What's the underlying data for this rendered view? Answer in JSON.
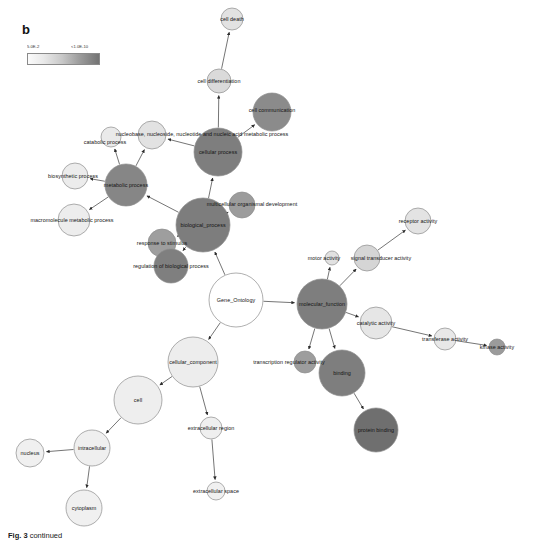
{
  "figure": {
    "panel_label": "b",
    "caption_prefix": "Fig. 3",
    "caption_text": "continued"
  },
  "legend": {
    "name": "p-value-color-scale",
    "min_label": "5.0E-2",
    "max_label": "<1.0E-10",
    "color_min": "#fbfbfb",
    "color_max": "#737373",
    "orientation": "horizontal"
  },
  "chart_data": {
    "type": "network",
    "legend_position": "top-left",
    "color_scale": {
      "label_low": "5.0E-2",
      "label_high": "<1.0E-10",
      "low_color": "#fbfbfb",
      "high_color": "#737373"
    },
    "encoding": {
      "node_color": "enrichment p-value (darker = more significant)",
      "node_size": "number of genes in category",
      "edge": "GO parent to child relationship"
    },
    "nodes": [
      {
        "id": "cell_death",
        "label": "cell death",
        "x": 232,
        "y": 19,
        "r": 11,
        "fill": "#e2e2e2",
        "label_dx": 0,
        "label_dy": 0
      },
      {
        "id": "cell_differentiation",
        "label": "cell differentiation",
        "x": 219,
        "y": 81,
        "r": 12,
        "fill": "#dadada",
        "label_dx": 0,
        "label_dy": 0
      },
      {
        "id": "cell_communication",
        "label": "cell communication",
        "x": 272,
        "y": 112,
        "r": 19,
        "fill": "#8b8b8b",
        "label_dx": 0,
        "label_dy": -2
      },
      {
        "id": "nucleobase_etc",
        "label": "nucleobase, nucleoside, nucleotide and nucleic acid metabolic process",
        "x": 152,
        "y": 135,
        "r": 14,
        "fill": "#e2e2e2",
        "label_dx": 50,
        "label_dy": -1
      },
      {
        "id": "catabolic_process",
        "label": "catabolic process",
        "x": 111,
        "y": 137,
        "r": 10,
        "fill": "#eaeaea",
        "label_dx": -6,
        "label_dy": 5
      },
      {
        "id": "cellular_process",
        "label": "cellular process",
        "x": 218,
        "y": 152,
        "r": 24,
        "fill": "#7e7e7e",
        "label_dx": 0,
        "label_dy": 0
      },
      {
        "id": "biosynthetic_process",
        "label": "biosynthetic process",
        "x": 75,
        "y": 176,
        "r": 13,
        "fill": "#ececec",
        "label_dx": -2,
        "label_dy": 0
      },
      {
        "id": "metabolic_process",
        "label": "metabolic process",
        "x": 126,
        "y": 185,
        "r": 21,
        "fill": "#868686",
        "label_dx": 0,
        "label_dy": 0
      },
      {
        "id": "multicellular_organismal_development",
        "label": "multicellular organismal development",
        "x": 242,
        "y": 205,
        "r": 13,
        "fill": "#9c9c9c",
        "label_dx": 10,
        "label_dy": -1
      },
      {
        "id": "macromolecule_metabolic_process",
        "label": "macromolecule metabolic process",
        "x": 74,
        "y": 220,
        "r": 16,
        "fill": "#ededed",
        "label_dx": -2,
        "label_dy": 0
      },
      {
        "id": "receptor_activity",
        "label": "receptor activity",
        "x": 418,
        "y": 221,
        "r": 13,
        "fill": "#e3e3e3",
        "label_dx": 0,
        "label_dy": 0
      },
      {
        "id": "biological_process",
        "label": "biological_process",
        "x": 203,
        "y": 225,
        "r": 27,
        "fill": "#7d7d7d",
        "label_dx": 0,
        "label_dy": 0
      },
      {
        "id": "response_to_stimulus",
        "label": "response to stimulus",
        "x": 162,
        "y": 243,
        "r": 14,
        "fill": "#9e9e9e",
        "label_dx": 0,
        "label_dy": 0
      },
      {
        "id": "signal_transducer_activity",
        "label": "signal transducer activity",
        "x": 367,
        "y": 258,
        "r": 13,
        "fill": "#d5d5d5",
        "label_dx": 14,
        "label_dy": 0
      },
      {
        "id": "motor_activity",
        "label": "motor activity",
        "x": 332,
        "y": 258,
        "r": 7,
        "fill": "#e1e1e1",
        "label_dx": -8,
        "label_dy": 0
      },
      {
        "id": "regulation_of_biological_process",
        "label": "regulation of biological process",
        "x": 171,
        "y": 266,
        "r": 17,
        "fill": "#7f7f7f",
        "label_dx": 0,
        "label_dy": 0
      },
      {
        "id": "gene_ontology",
        "label": "Gene_Ontology",
        "x": 236,
        "y": 300,
        "r": 27,
        "fill": "#ffffff",
        "label_dx": 0,
        "label_dy": 0
      },
      {
        "id": "molecular_function",
        "label": "molecular_function",
        "x": 322,
        "y": 304,
        "r": 25,
        "fill": "#7e7e7e",
        "label_dx": 0,
        "label_dy": 0
      },
      {
        "id": "catalytic_activity",
        "label": "catalytic activity",
        "x": 376,
        "y": 323,
        "r": 16,
        "fill": "#e6e6e6",
        "label_dx": 0,
        "label_dy": 0
      },
      {
        "id": "transferase_activity",
        "label": "transferase activity",
        "x": 445,
        "y": 339,
        "r": 11,
        "fill": "#e8e8e8",
        "label_dx": 0,
        "label_dy": 0
      },
      {
        "id": "kinase_activity",
        "label": "kinase activity",
        "x": 497,
        "y": 347,
        "r": 8,
        "fill": "#9b9b9b",
        "label_dx": 0,
        "label_dy": 0
      },
      {
        "id": "cellular_component",
        "label": "cellular_component",
        "x": 193,
        "y": 362,
        "r": 25,
        "fill": "#ededed",
        "label_dx": 0,
        "label_dy": 0
      },
      {
        "id": "transcription_regulator_activity",
        "label": "transcription regulator activity",
        "x": 305,
        "y": 362,
        "r": 11,
        "fill": "#9d9d9d",
        "label_dx": -16,
        "label_dy": 0
      },
      {
        "id": "binding",
        "label": "binding",
        "x": 342,
        "y": 373,
        "r": 23,
        "fill": "#7e7e7e",
        "label_dx": 0,
        "label_dy": 0
      },
      {
        "id": "cell",
        "label": "cell",
        "x": 138,
        "y": 400,
        "r": 24,
        "fill": "#eeeeee",
        "label_dx": 0,
        "label_dy": 0
      },
      {
        "id": "extracellular_region",
        "label": "extracellular region",
        "x": 211,
        "y": 428,
        "r": 11,
        "fill": "#efefef",
        "label_dx": 0,
        "label_dy": 0
      },
      {
        "id": "protein_binding",
        "label": "protein binding",
        "x": 376,
        "y": 430,
        "r": 22,
        "fill": "#6f6f6f",
        "label_dx": 0,
        "label_dy": 0
      },
      {
        "id": "intracellular",
        "label": "intracellular",
        "x": 92,
        "y": 448,
        "r": 18,
        "fill": "#efefef",
        "label_dx": 0,
        "label_dy": 0
      },
      {
        "id": "nucleus",
        "label": "nucleus",
        "x": 30,
        "y": 453,
        "r": 14,
        "fill": "#f0f0f0",
        "label_dx": 0,
        "label_dy": 0
      },
      {
        "id": "extracellular_space",
        "label": "extracellular space",
        "x": 216,
        "y": 491,
        "r": 9,
        "fill": "#f0f0f0",
        "label_dx": 0,
        "label_dy": 0
      },
      {
        "id": "cytoplasm",
        "label": "cytoplasm",
        "x": 84,
        "y": 508,
        "r": 18,
        "fill": "#f0f0f0",
        "label_dx": 0,
        "label_dy": 0
      }
    ],
    "edges": [
      {
        "from": "cell_differentiation",
        "to": "cell_death"
      },
      {
        "from": "cellular_process",
        "to": "cell_differentiation"
      },
      {
        "from": "cellular_process",
        "to": "cell_communication"
      },
      {
        "from": "cellular_process",
        "to": "nucleobase_etc"
      },
      {
        "from": "metabolic_process",
        "to": "catabolic_process"
      },
      {
        "from": "metabolic_process",
        "to": "nucleobase_etc"
      },
      {
        "from": "metabolic_process",
        "to": "biosynthetic_process"
      },
      {
        "from": "metabolic_process",
        "to": "macromolecule_metabolic_process"
      },
      {
        "from": "biological_process",
        "to": "metabolic_process"
      },
      {
        "from": "biological_process",
        "to": "cellular_process"
      },
      {
        "from": "biological_process",
        "to": "multicellular_organismal_development"
      },
      {
        "from": "biological_process",
        "to": "response_to_stimulus"
      },
      {
        "from": "biological_process",
        "to": "regulation_of_biological_process"
      },
      {
        "from": "gene_ontology",
        "to": "biological_process"
      },
      {
        "from": "gene_ontology",
        "to": "molecular_function"
      },
      {
        "from": "gene_ontology",
        "to": "cellular_component"
      },
      {
        "from": "molecular_function",
        "to": "motor_activity"
      },
      {
        "from": "molecular_function",
        "to": "signal_transducer_activity"
      },
      {
        "from": "signal_transducer_activity",
        "to": "receptor_activity"
      },
      {
        "from": "molecular_function",
        "to": "catalytic_activity"
      },
      {
        "from": "catalytic_activity",
        "to": "transferase_activity"
      },
      {
        "from": "transferase_activity",
        "to": "kinase_activity"
      },
      {
        "from": "molecular_function",
        "to": "transcription_regulator_activity"
      },
      {
        "from": "molecular_function",
        "to": "binding"
      },
      {
        "from": "binding",
        "to": "protein_binding"
      },
      {
        "from": "cellular_component",
        "to": "cell"
      },
      {
        "from": "cellular_component",
        "to": "extracellular_region"
      },
      {
        "from": "extracellular_region",
        "to": "extracellular_space"
      },
      {
        "from": "cell",
        "to": "intracellular"
      },
      {
        "from": "intracellular",
        "to": "nucleus"
      },
      {
        "from": "intracellular",
        "to": "cytoplasm"
      }
    ]
  }
}
